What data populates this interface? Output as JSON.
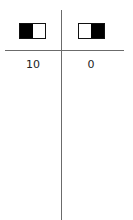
{
  "columns": [
    {
      "icon": "toggle-left-filled-icon",
      "value": "10"
    },
    {
      "icon": "toggle-right-filled-icon",
      "value": "0"
    }
  ],
  "colors": {
    "line": "#6b6b6b",
    "fill": "#000000"
  }
}
